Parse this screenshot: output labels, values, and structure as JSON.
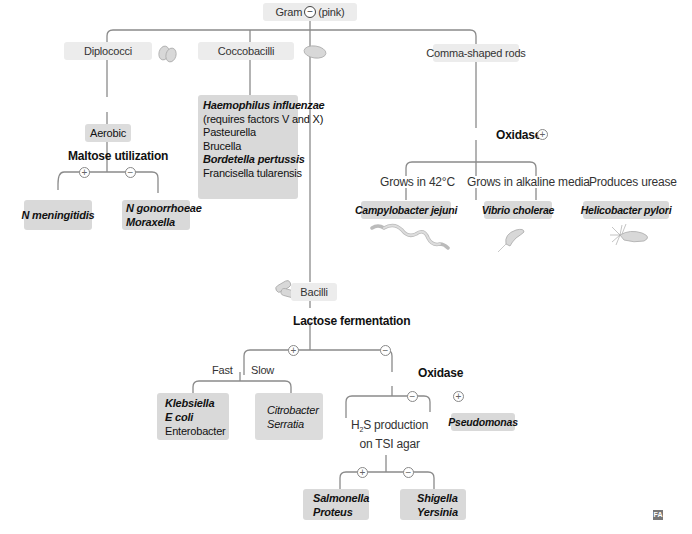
{
  "root": {
    "label": "Gram",
    "sign": "−",
    "suffix": "(pink)"
  },
  "branches": {
    "diplococci": {
      "label": "Diplococci",
      "shape_icon": "diplococcus-icon",
      "sub": "Aerobic",
      "test": "Maltose utilization",
      "pos_sign": "+",
      "neg_sign": "−",
      "positive": [
        "N meningitidis"
      ],
      "negative": [
        "N gonorrhoeae",
        "Moraxella"
      ]
    },
    "coccobacilli": {
      "label": "Coccobacilli",
      "shape_icon": "coccobacillus-icon",
      "organisms": [
        {
          "name": "Haemophilus influenzae",
          "style": "bold-italic"
        },
        {
          "name": " (requires factors V and X)",
          "style": "normal"
        },
        {
          "name": "Pasteurella",
          "style": "normal"
        },
        {
          "name": "Brucella",
          "style": "normal"
        },
        {
          "name": "Bordetella pertussis",
          "style": "bold-italic"
        },
        {
          "name": "Francisella tularensis",
          "style": "normal"
        }
      ]
    },
    "comma": {
      "label": "Comma-shaped rods",
      "test": "Oxidase",
      "test_sign": "+",
      "groups": [
        {
          "condition": "Grows in 42°C",
          "organism": "Campylobacter jejuni",
          "icon": "campylobacter-icon"
        },
        {
          "condition": "Grows in alkaline media",
          "organism": "Vibrio cholerae",
          "icon": "vibrio-icon"
        },
        {
          "condition": "Produces urease",
          "organism": "Helicobacter pylori",
          "icon": "helicobacter-icon"
        }
      ]
    },
    "bacilli": {
      "label": "Bacilli",
      "shape_icon": "bacillus-icon",
      "test": "Lactose fermentation",
      "pos_sign": "+",
      "neg_sign": "−",
      "fast_label": "Fast",
      "slow_label": "Slow",
      "fast": [
        {
          "name": "Klebsiella",
          "style": "bold-italic"
        },
        {
          "name": "E coli",
          "style": "bold-italic"
        },
        {
          "name": "Enterobacter",
          "style": "normal"
        }
      ],
      "slow": [
        {
          "name": "Citrobacter",
          "style": "italic"
        },
        {
          "name": "Serratia",
          "style": "italic"
        }
      ],
      "oxidase": {
        "label": "Oxidase",
        "neg_sign": "−",
        "pos_sign": "+",
        "positive": "Pseudomonas",
        "h2s_line1": "H",
        "h2s_sub": "2",
        "h2s_line1b": "S production",
        "h2s_line2": "on TSI agar",
        "h2s_pos_sign": "+",
        "h2s_neg_sign": "−",
        "h2s_positive": [
          "Salmonella",
          "Proteus"
        ],
        "h2s_negative": [
          "Shigella",
          "Yersinia"
        ]
      }
    }
  },
  "logo": "FA"
}
